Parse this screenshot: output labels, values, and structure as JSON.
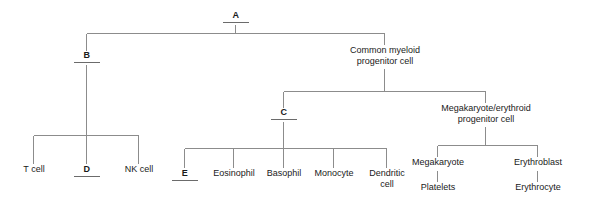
{
  "figure": {
    "background_color": "#ffffff",
    "line_color": "#8c8c8c",
    "text_color": "#1a1a1a",
    "underline_color": "#6b6b6b"
  },
  "nodes": {
    "a": "A",
    "b": "B",
    "c": "C",
    "d": "D",
    "e": "E",
    "common_myeloid": "Common myeloid\nprogenitor cell",
    "megakaryote_erythroid": "Megakaryote/erythroid\nprogenitor cell",
    "t_cell": "T cell",
    "nk_cell": "NK cell",
    "eosinophil": "Eosinophil",
    "basophil": "Basophil",
    "monocyte": "Monocyte",
    "dendritic_cell": "Dendritic\ncell",
    "megakaryote": "Megakaryote",
    "platelets": "Platelets",
    "erythroblast": "Erythroblast",
    "erythrocyte": "Erythrocyte"
  }
}
